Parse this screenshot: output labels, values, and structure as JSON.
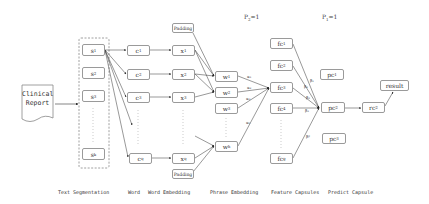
{
  "diagram": {
    "input": {
      "line1": "Clinical",
      "line2": "Report"
    },
    "segments": [
      {
        "base": "s",
        "sub": "1"
      },
      {
        "base": "s",
        "sub": "2"
      },
      {
        "base": "s",
        "sub": "3"
      },
      {
        "base": "s",
        "sub": "k"
      }
    ],
    "words": [
      {
        "base": "c",
        "sub": "1"
      },
      {
        "base": "c",
        "sub": "2"
      },
      {
        "base": "c",
        "sub": "3"
      },
      {
        "base": "c",
        "sub": "q"
      }
    ],
    "embeddings": [
      {
        "base": "x",
        "sub": "1"
      },
      {
        "base": "x",
        "sub": "2"
      },
      {
        "base": "x",
        "sub": "3"
      },
      {
        "base": "x",
        "sub": "q"
      }
    ],
    "padding_label": "Padding",
    "phrases": [
      {
        "base": "w",
        "sub": "1"
      },
      {
        "base": "w",
        "sub": "2"
      },
      {
        "base": "w",
        "sub": "3"
      },
      {
        "base": "w",
        "sub": "h"
      }
    ],
    "features": [
      {
        "base": "fc",
        "sub": "1"
      },
      {
        "base": "fc",
        "sub": "2"
      },
      {
        "base": "fc",
        "sub": "3"
      },
      {
        "base": "fc",
        "sub": "4"
      },
      {
        "base": "fc",
        "sub": "g"
      }
    ],
    "predicts": [
      {
        "base": "pc",
        "sub": "1"
      },
      {
        "base": "pc",
        "sub": "2"
      },
      {
        "base": "pc",
        "sub": "3"
      }
    ],
    "rc": {
      "base": "rc",
      "sub": "2"
    },
    "result": "result",
    "p2_label": "P",
    "p2_sub": "2",
    "p2_value": "=1",
    "p1_label": "P",
    "p1_sub": "1",
    "p1_value": "=1",
    "edge_weights_phrase": [
      "α₁",
      "α₂",
      "α₃",
      "αₕ"
    ],
    "edge_weights_feature": [
      "β₁",
      "β₂",
      "β₃",
      "β₄",
      "βᵍ"
    ],
    "stage_labels": {
      "text_segmentation": "Text Segmentation",
      "word": "Word",
      "word_embedding": "Word Embedding",
      "phrase_embedding": "Phrase Embedding",
      "feature_capsules": "Feature Capsules",
      "predict_capsule": "Predict Capsule"
    }
  }
}
